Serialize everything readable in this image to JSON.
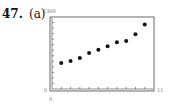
{
  "problem": {
    "number": "47.",
    "part": "(a)"
  },
  "chart_data": {
    "type": "scatter",
    "title": "",
    "xlabel": "",
    "ylabel": "",
    "xlim": [
      0,
      11
    ],
    "ylim": [
      0,
      1300
    ],
    "x_tick_labels": {
      "min": "0",
      "max": "11"
    },
    "y_tick_labels": {
      "min": "0",
      "max": "1300"
    },
    "x_ticks": [
      1,
      2,
      3,
      4,
      5,
      6,
      7,
      8,
      9,
      10
    ],
    "y_ticks_count": 13,
    "grid": false,
    "legend": "none",
    "x": [
      1,
      2,
      3,
      4,
      5,
      6,
      7,
      8,
      9,
      10
    ],
    "y": [
      470,
      505,
      560,
      650,
      710,
      770,
      845,
      865,
      990,
      1165
    ],
    "marker_color": "#111111"
  }
}
